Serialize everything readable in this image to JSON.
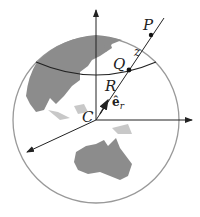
{
  "diagram": {
    "labels": {
      "P": "P",
      "Q": "Q",
      "z": "z",
      "R": "R",
      "C": "C",
      "er": "ê",
      "er_sub": "r"
    },
    "colors": {
      "land": "#8c8c8c",
      "outline": "#999999",
      "lines": "#222222"
    }
  }
}
